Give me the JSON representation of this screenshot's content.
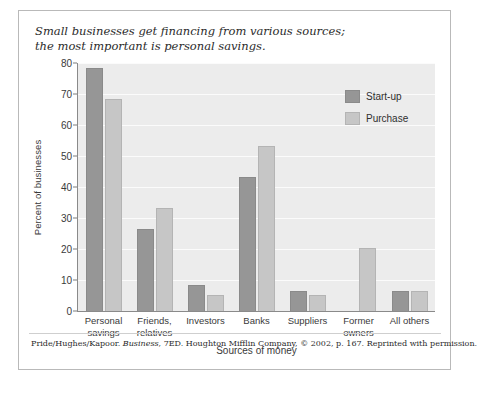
{
  "caption": {
    "line1": "Small businesses get financing from various sources;",
    "line2": "the most important is personal savings."
  },
  "credit": {
    "prefix": "Pride/Hughes/Kapoor. ",
    "work": "Business",
    "suffix": ", 7ED. Houghton Mifflin Company, © 2002, p. 167. Reprinted with permission."
  },
  "legend": {
    "position": "top-right",
    "items": [
      {
        "label": "Start-up",
        "color": "#969696"
      },
      {
        "label": "Purchase",
        "color": "#c6c6c6"
      }
    ]
  },
  "chart_data": {
    "type": "bar",
    "title": "",
    "xlabel": "Sources of money",
    "ylabel": "Percent of businesses",
    "ylim": [
      0,
      80
    ],
    "yticks": [
      0,
      10,
      20,
      30,
      40,
      50,
      60,
      70,
      80
    ],
    "grid": true,
    "categories": [
      {
        "line1": "Personal",
        "line2": "savings"
      },
      {
        "line1": "Friends,",
        "line2": "relatives"
      },
      {
        "line1": "Investors",
        "line2": ""
      },
      {
        "line1": "Banks",
        "line2": ""
      },
      {
        "line1": "Suppliers",
        "line2": ""
      },
      {
        "line1": "Former",
        "line2": "owners"
      },
      {
        "line1": "All others",
        "line2": ""
      }
    ],
    "series": [
      {
        "name": "Start-up",
        "color": "#969696",
        "values": [
          78,
          26,
          8,
          43,
          6,
          0,
          6
        ]
      },
      {
        "name": "Purchase",
        "color": "#c6c6c6",
        "values": [
          68,
          33,
          5,
          53,
          5,
          20,
          6
        ]
      }
    ]
  }
}
